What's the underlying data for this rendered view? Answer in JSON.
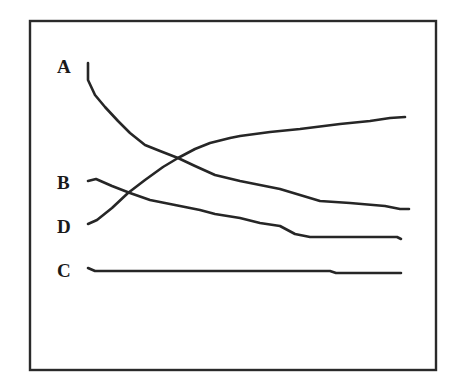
{
  "chart_data": {
    "type": "line",
    "title": "",
    "xlabel": "",
    "ylabel": "",
    "grid": false,
    "legend": "inline labels at left end of each line",
    "axes_ticks": "none",
    "frame": {
      "x1": 30,
      "y1": 21,
      "x2": 436,
      "y2": 370
    },
    "series": [
      {
        "name": "A",
        "label_pos": [
          57,
          73
        ],
        "points": [
          [
            88,
            63
          ],
          [
            88,
            80
          ],
          [
            95,
            95
          ],
          [
            105,
            107
          ],
          [
            118,
            121
          ],
          [
            130,
            133
          ],
          [
            145,
            145
          ],
          [
            160,
            151
          ],
          [
            178,
            158
          ],
          [
            195,
            166
          ],
          [
            215,
            175
          ],
          [
            240,
            181
          ],
          [
            280,
            189
          ],
          [
            320,
            201
          ],
          [
            350,
            203
          ],
          [
            385,
            206
          ],
          [
            400,
            209
          ],
          [
            409,
            209
          ]
        ]
      },
      {
        "name": "B",
        "label_pos": [
          57,
          189
        ],
        "points": [
          [
            88,
            181
          ],
          [
            96,
            179
          ],
          [
            112,
            186
          ],
          [
            130,
            193
          ],
          [
            150,
            200
          ],
          [
            175,
            205
          ],
          [
            200,
            210
          ],
          [
            215,
            214
          ],
          [
            240,
            218
          ],
          [
            260,
            223
          ],
          [
            280,
            226
          ],
          [
            295,
            234
          ],
          [
            310,
            237
          ],
          [
            340,
            237
          ],
          [
            370,
            237
          ],
          [
            397,
            237
          ],
          [
            401,
            239
          ]
        ]
      },
      {
        "name": "D",
        "label_pos": [
          57,
          233
        ],
        "points": [
          [
            88,
            224
          ],
          [
            97,
            220
          ],
          [
            112,
            208
          ],
          [
            128,
            193
          ],
          [
            145,
            180
          ],
          [
            163,
            167
          ],
          [
            178,
            158
          ],
          [
            195,
            149
          ],
          [
            210,
            143
          ],
          [
            230,
            138
          ],
          [
            240,
            136
          ],
          [
            270,
            132
          ],
          [
            300,
            129
          ],
          [
            340,
            124
          ],
          [
            370,
            121
          ],
          [
            390,
            118
          ],
          [
            405,
            117
          ]
        ]
      },
      {
        "name": "C",
        "label_pos": [
          57,
          277
        ],
        "points": [
          [
            88,
            268
          ],
          [
            95,
            271
          ],
          [
            150,
            271
          ],
          [
            200,
            271
          ],
          [
            250,
            271
          ],
          [
            300,
            271
          ],
          [
            330,
            271
          ],
          [
            336,
            273
          ],
          [
            370,
            273
          ],
          [
            401,
            273
          ]
        ]
      }
    ]
  }
}
